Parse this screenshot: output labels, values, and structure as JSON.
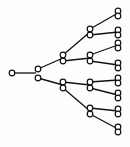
{
  "diagram": {
    "type": "binary-tree",
    "orientation": "left-to-right",
    "colors": {
      "stroke": "#111111",
      "node_fill": "#ffffff",
      "background": "#fdfdfd"
    },
    "node_radius": 2.8,
    "nodes": [
      {
        "id": "root",
        "level": 0,
        "x": 12,
        "y": 73
      },
      {
        "id": "L1a",
        "level": 1,
        "x": 38,
        "y": 69
      },
      {
        "id": "L1b",
        "level": 1,
        "x": 38,
        "y": 78
      },
      {
        "id": "L2a",
        "level": 2,
        "x": 63,
        "y": 55
      },
      {
        "id": "L2b",
        "level": 2,
        "x": 63,
        "y": 61
      },
      {
        "id": "L2c",
        "level": 2,
        "x": 63,
        "y": 82
      },
      {
        "id": "L2d",
        "level": 2,
        "x": 63,
        "y": 88
      },
      {
        "id": "L3a",
        "level": 3,
        "x": 90,
        "y": 29
      },
      {
        "id": "L3b",
        "level": 3,
        "x": 90,
        "y": 35
      },
      {
        "id": "L3c",
        "level": 3,
        "x": 90,
        "y": 55
      },
      {
        "id": "L3d",
        "level": 3,
        "x": 90,
        "y": 61
      },
      {
        "id": "L3e",
        "level": 3,
        "x": 90,
        "y": 82
      },
      {
        "id": "L3f",
        "level": 3,
        "x": 90,
        "y": 88
      },
      {
        "id": "L3g",
        "level": 3,
        "x": 90,
        "y": 108
      },
      {
        "id": "L3h",
        "level": 3,
        "x": 90,
        "y": 114
      },
      {
        "id": "L4a",
        "level": 4,
        "x": 118,
        "y": 11
      },
      {
        "id": "L4b",
        "level": 4,
        "x": 118,
        "y": 16
      },
      {
        "id": "L4c",
        "level": 4,
        "x": 118,
        "y": 30
      },
      {
        "id": "L4d",
        "level": 4,
        "x": 118,
        "y": 35
      },
      {
        "id": "L4e",
        "level": 4,
        "x": 118,
        "y": 43
      },
      {
        "id": "L4f",
        "level": 4,
        "x": 118,
        "y": 48
      },
      {
        "id": "L4g",
        "level": 4,
        "x": 118,
        "y": 63
      },
      {
        "id": "L4h",
        "level": 4,
        "x": 118,
        "y": 68
      },
      {
        "id": "L4i",
        "level": 4,
        "x": 118,
        "y": 78
      },
      {
        "id": "L4j",
        "level": 4,
        "x": 118,
        "y": 83
      },
      {
        "id": "L4k",
        "level": 4,
        "x": 118,
        "y": 93
      },
      {
        "id": "L4l",
        "level": 4,
        "x": 118,
        "y": 98
      },
      {
        "id": "L4m",
        "level": 4,
        "x": 118,
        "y": 109
      },
      {
        "id": "L4n",
        "level": 4,
        "x": 118,
        "y": 114
      },
      {
        "id": "L4o",
        "level": 4,
        "x": 118,
        "y": 127
      },
      {
        "id": "L4p",
        "level": 4,
        "x": 118,
        "y": 132
      }
    ],
    "edges": [
      {
        "from": [
          12,
          73
        ],
        "to": [
          36,
          73
        ]
      },
      {
        "from": [
          38,
          69
        ],
        "to": [
          63,
          58
        ]
      },
      {
        "from": [
          38,
          78
        ],
        "to": [
          63,
          85
        ]
      },
      {
        "from": [
          63,
          55
        ],
        "to": [
          90,
          32
        ]
      },
      {
        "from": [
          63,
          61
        ],
        "to": [
          90,
          58
        ]
      },
      {
        "from": [
          63,
          82
        ],
        "to": [
          90,
          85
        ]
      },
      {
        "from": [
          63,
          88
        ],
        "to": [
          90,
          111
        ]
      },
      {
        "from": [
          90,
          29
        ],
        "to": [
          118,
          13
        ]
      },
      {
        "from": [
          90,
          35
        ],
        "to": [
          118,
          32
        ]
      },
      {
        "from": [
          90,
          55
        ],
        "to": [
          118,
          45
        ]
      },
      {
        "from": [
          90,
          61
        ],
        "to": [
          118,
          65
        ]
      },
      {
        "from": [
          90,
          82
        ],
        "to": [
          118,
          80
        ]
      },
      {
        "from": [
          90,
          88
        ],
        "to": [
          118,
          95
        ]
      },
      {
        "from": [
          90,
          108
        ],
        "to": [
          118,
          111
        ]
      },
      {
        "from": [
          90,
          114
        ],
        "to": [
          118,
          129
        ]
      }
    ]
  }
}
